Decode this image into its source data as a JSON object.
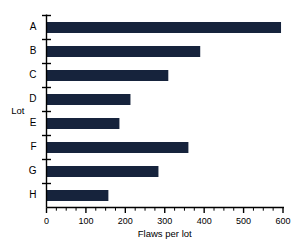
{
  "chart_data": {
    "type": "bar",
    "orientation": "horizontal",
    "title": "",
    "xlabel": "Flaws per lot",
    "ylabel": "Lot",
    "categories": [
      "A",
      "B",
      "C",
      "D",
      "E",
      "F",
      "G",
      "H"
    ],
    "values": [
      595,
      390,
      309,
      213,
      185,
      360,
      284,
      157
    ],
    "xlim": [
      0,
      600
    ],
    "ylim": [
      0,
      8
    ],
    "xticks": [
      0,
      100,
      200,
      300,
      400,
      500,
      600
    ],
    "xticklabels": [
      "0",
      "100",
      "200",
      "300",
      "400",
      "500",
      "600"
    ],
    "minor_tick_interval": 25,
    "grid": false,
    "legend": false,
    "bar_color": "#16233c",
    "axis_color": "#000000",
    "background_color": "#ffffff"
  }
}
